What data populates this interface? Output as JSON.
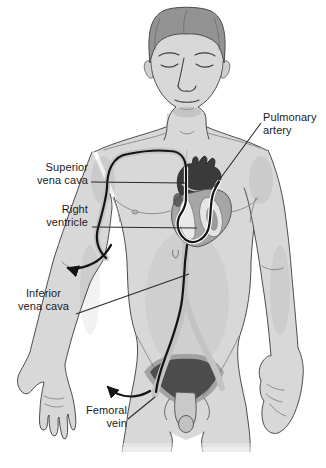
{
  "illustration": {
    "labels": {
      "pulmonary_artery": "Pulmonary\nartery",
      "superior_vena_cava": "Superior\nvena cava",
      "right_ventricle": "Right\nventricle",
      "inferior_vena_cava": "Inferior\nvena cava",
      "femoral_vein": "Femoral\nvein"
    },
    "icons": {
      "arm_insertion_arrow": "curved-arrow",
      "groin_insertion_arrow": "curved-arrow"
    },
    "colors": {
      "background": "#ffffff",
      "skin": "#d8d8d8",
      "body_outline": "#4d4d4d",
      "catheter": "#141414",
      "vein": "#c5c5c5",
      "heart_vessels": "#3a3a3a",
      "label_text": "#1a1a1a"
    }
  }
}
